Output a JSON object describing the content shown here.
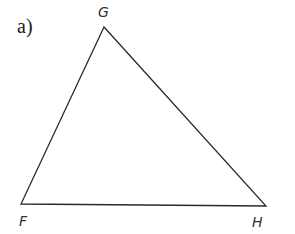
{
  "part_label": "a)",
  "triangle": {
    "vertices": [
      {
        "name": "G",
        "x": 104,
        "y": 27
      },
      {
        "name": "F",
        "x": 21,
        "y": 204
      },
      {
        "name": "H",
        "x": 266,
        "y": 206
      }
    ],
    "labels": {
      "G": "G",
      "F": "F",
      "H": "H"
    },
    "stroke_color": "#2a2a2a"
  }
}
